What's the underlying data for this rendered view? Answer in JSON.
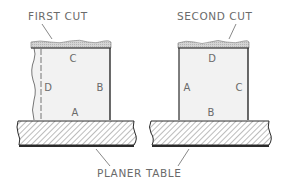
{
  "diagram": {
    "labels": {
      "first_cut": "FIRST CUT",
      "second_cut": "SECOND CUT",
      "planer_table": "PLANER TABLE"
    },
    "left_block": {
      "faces": {
        "top": "C",
        "left": "D",
        "right": "B",
        "bottom": "A"
      }
    },
    "right_block": {
      "faces": {
        "top": "D",
        "left": "A",
        "right": "C",
        "bottom": "B"
      }
    },
    "colors": {
      "outline": "#2a2a2a",
      "block_fill": "#f2f2f2",
      "cut_fill": "#c8c8c8",
      "hatch": "#7a7a7a",
      "text": "#6a6a6a"
    }
  }
}
